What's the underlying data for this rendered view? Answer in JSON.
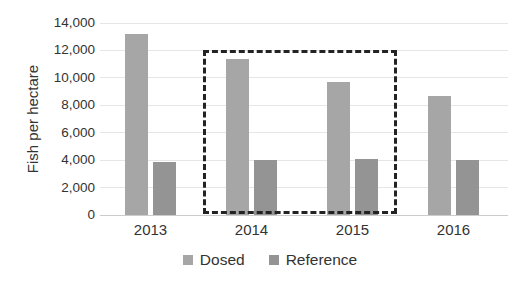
{
  "chart_data": {
    "type": "bar",
    "title": "",
    "xlabel": "",
    "ylabel": "Fish per hectare",
    "categories": [
      "2013",
      "2014",
      "2015",
      "2016"
    ],
    "series": [
      {
        "name": "Dosed",
        "values": [
          13200,
          11400,
          9700,
          8700
        ],
        "color": "#a6a6a6"
      },
      {
        "name": "Reference",
        "values": [
          3900,
          4000,
          4100,
          4000
        ],
        "color": "#949494"
      }
    ],
    "ylim": [
      0,
      14000
    ],
    "ytick_step": 2000,
    "ytick_labels": [
      "0",
      "2,000",
      "4,000",
      "6,000",
      "8,000",
      "10,000",
      "12,000",
      "14,000"
    ],
    "grid": true,
    "legend_position": "bottom",
    "style": {
      "grid_color": "#e6e6e6",
      "axis_line_color": "#cccccc",
      "text_color": "#333333",
      "highlight_box_color": "#232323",
      "background": "#ffffff"
    },
    "annotations": [
      {
        "type": "dashed-box",
        "from_category": "2014",
        "to_category": "2015",
        "top_value": 12000,
        "note": "dashed rectangle highlighting the 2014 and 2015 bar groups"
      }
    ]
  }
}
